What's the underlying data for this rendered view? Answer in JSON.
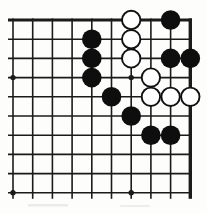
{
  "board": {
    "game": "go",
    "diagram_type": "corner-problem-diagram",
    "visible_cols": 10,
    "visible_rows": 10,
    "thick_edges": [
      "top",
      "right"
    ],
    "open_edges": [
      "left",
      "bottom"
    ],
    "star_points": [
      [
        1,
        4
      ],
      [
        7,
        4
      ],
      [
        1,
        10
      ],
      [
        7,
        10
      ]
    ],
    "black_stones": [
      [
        9,
        1
      ],
      [
        5,
        2
      ],
      [
        5,
        3
      ],
      [
        9,
        3
      ],
      [
        10,
        3
      ],
      [
        5,
        4
      ],
      [
        6,
        5
      ],
      [
        7,
        6
      ],
      [
        8,
        7
      ],
      [
        9,
        7
      ]
    ],
    "white_stones": [
      [
        7,
        1
      ],
      [
        7,
        2
      ],
      [
        7,
        3
      ],
      [
        8,
        4
      ],
      [
        8,
        5
      ],
      [
        9,
        5
      ],
      [
        10,
        5
      ]
    ],
    "colors": {
      "line": "#1b1b1b",
      "paper": "#fdfdfb",
      "black_stone": "#0e0e0e",
      "white_stone": "#ffffff",
      "stone_outline": "#111111",
      "scan_smudge": "#c9c9c9"
    }
  }
}
